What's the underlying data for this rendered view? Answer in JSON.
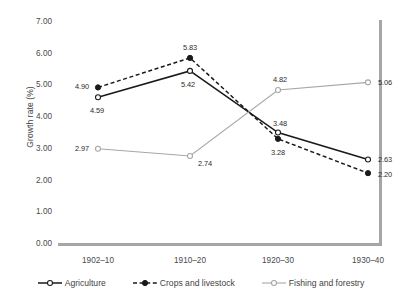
{
  "chart_data": {
    "type": "line",
    "title": "",
    "xlabel": "",
    "ylabel": "Growth rate (%)",
    "categories": [
      "1902–10",
      "1910–20",
      "1920–30",
      "1930–40"
    ],
    "ylim": [
      0.0,
      7.0
    ],
    "ytick_step": 1.0,
    "ytick_labels": [
      "7.00",
      "6.00",
      "5.00",
      "4.00",
      "3.00",
      "2.00",
      "1.00",
      "0.00"
    ],
    "ytick_values": [
      7.0,
      6.0,
      5.0,
      4.0,
      3.0,
      2.0,
      1.0,
      0.0
    ],
    "grid": false,
    "legend_position": "bottom",
    "series": [
      {
        "name": "Agriculture",
        "values": [
          4.59,
          5.42,
          3.48,
          2.63
        ],
        "labels": [
          "4.59",
          "5.42",
          "3.48",
          "2.63"
        ],
        "color": "#1a1a1a",
        "line_style": "solid",
        "marker": "open-circle"
      },
      {
        "name": "Crops and livestock",
        "values": [
          4.9,
          5.83,
          3.28,
          2.2
        ],
        "labels": [
          "4.90",
          "5.83",
          "3.28",
          "2.20"
        ],
        "color": "#1a1a1a",
        "line_style": "dashed",
        "marker": "filled-circle"
      },
      {
        "name": "Fishing and forestry",
        "values": [
          2.97,
          2.74,
          4.82,
          5.06
        ],
        "labels": [
          "2.97",
          "2.74",
          "4.82",
          "5.06"
        ],
        "color": "#a6a6a6",
        "line_style": "solid",
        "marker": "open-circle"
      }
    ]
  },
  "axis": {
    "y_title": "Growth rate (%)"
  },
  "legend": {
    "items": [
      {
        "label": "Agriculture"
      },
      {
        "label": "Crops and livestock"
      },
      {
        "label": "Fishing and forestry"
      }
    ]
  }
}
